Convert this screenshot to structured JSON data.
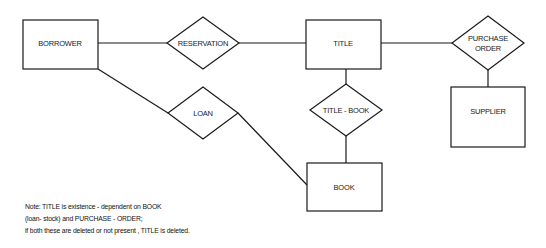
{
  "diagram": {
    "type": "entity-relationship",
    "entities": [
      {
        "id": "borrower",
        "label": "BORROWER",
        "x": 23,
        "y": 20,
        "w": 75,
        "h": 49
      },
      {
        "id": "title",
        "label": "TITLE",
        "x": 306,
        "y": 20,
        "w": 75,
        "h": 49
      },
      {
        "id": "supplier",
        "label": "SUPPLIER",
        "x": 451,
        "y": 87,
        "w": 74,
        "h": 60
      },
      {
        "id": "book",
        "label": "BOOK",
        "x": 307,
        "y": 163,
        "w": 75,
        "h": 48
      }
    ],
    "relationships": [
      {
        "id": "reservation",
        "label": "RESERVATION",
        "cx": 203,
        "cy": 43,
        "hw": 36,
        "hh": 26
      },
      {
        "id": "purchase_order",
        "label_line1": "PURCHASE",
        "label_line2": "ORDER",
        "cx": 488,
        "cy": 43,
        "hw": 36,
        "hh": 27
      },
      {
        "id": "title_book",
        "label": "TITLE - BOOK",
        "cx": 346,
        "cy": 110,
        "hw": 36,
        "hh": 26
      },
      {
        "id": "loan",
        "label": "LOAN",
        "cx": 203,
        "cy": 113,
        "hw": 35,
        "hh": 26
      }
    ],
    "connections": [
      {
        "from": "borrower",
        "to": "reservation"
      },
      {
        "from": "reservation",
        "to": "title"
      },
      {
        "from": "title",
        "to": "purchase_order"
      },
      {
        "from": "purchase_order",
        "to": "supplier"
      },
      {
        "from": "title",
        "to": "title_book"
      },
      {
        "from": "title_book",
        "to": "book"
      },
      {
        "from": "borrower",
        "to": "loan"
      },
      {
        "from": "loan",
        "to": "book"
      }
    ]
  },
  "note": {
    "line1": "Note: TITLE is existence - dependent on BOOK",
    "line2": "(loan- stock) and PURCHASE - ORDER;",
    "line3": "if both these are deleted or not present , TITLE is deleted."
  }
}
